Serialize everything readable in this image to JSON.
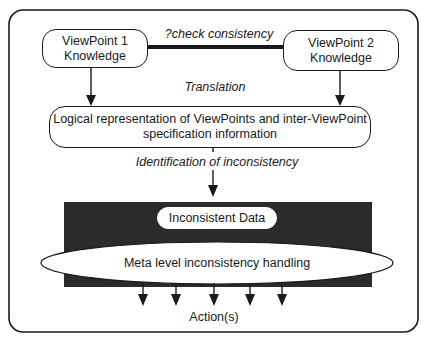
{
  "diagram": {
    "nodes": {
      "viewpoint1": {
        "line1": "ViewPoint 1",
        "line2": "Knowledge"
      },
      "viewpoint2": {
        "line1": "ViewPoint 2",
        "line2": "Knowledge"
      },
      "logical_rep": {
        "line1": "Logical representation of ViewPoints and inter-ViewPoint",
        "line2": "specification information"
      },
      "inconsistent_data": "Inconsistent Data",
      "meta_handling": "Meta level inconsistency handling"
    },
    "edge_labels": {
      "check_consistency": "?check consistency",
      "translation": "Translation",
      "identification": "Identification of inconsistency",
      "actions": "Action(s)"
    },
    "colors": {
      "line": "#1a1a1a",
      "dark_panel": "#2b2b2b",
      "background": "#ffffff"
    }
  }
}
